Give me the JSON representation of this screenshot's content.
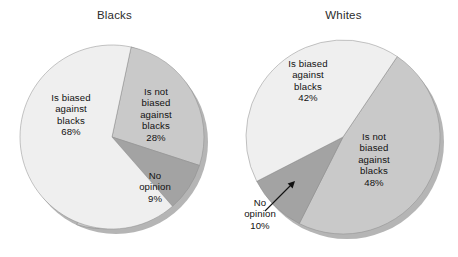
{
  "figure": {
    "background_color": "#ffffff",
    "width": 458,
    "height": 257
  },
  "palette": {
    "slice_light": "#efefef",
    "slice_medium": "#c9c9c9",
    "slice_dark": "#a3a3a3",
    "shadow": "#b5b5b5",
    "edge": "#8d8d8d",
    "text": "#111111",
    "title_text": "#2b2b2b"
  },
  "chart_data": [
    {
      "type": "pie",
      "title": "Blacks",
      "labels": [
        "Is not biased against blacks",
        "No opinion",
        "Is biased against blacks"
      ],
      "values": [
        28,
        9,
        68
      ],
      "value_labels": [
        "28%",
        "9%",
        "68%"
      ],
      "colors": [
        "#c9c9c9",
        "#a3a3a3",
        "#efefef"
      ],
      "legend": "none",
      "start_angle_deg": 12,
      "direction": "clockwise",
      "annotations": [
        {
          "label_lines": [
            "Is not",
            "biased",
            "against",
            "blacks"
          ],
          "percent": "28%",
          "placement": "inside"
        },
        {
          "label_lines": [
            "No",
            "opinion"
          ],
          "percent": "9%",
          "placement": "inside"
        },
        {
          "label_lines": [
            "Is biased",
            "against",
            "blacks"
          ],
          "percent": "68%",
          "placement": "inside"
        }
      ]
    },
    {
      "type": "pie",
      "title": "Whites",
      "labels": [
        "Is not biased against blacks",
        "No opinion",
        "Is biased against blacks"
      ],
      "values": [
        48,
        10,
        42
      ],
      "value_labels": [
        "48%",
        "10%",
        "42%"
      ],
      "colors": [
        "#c9c9c9",
        "#a3a3a3",
        "#efefef"
      ],
      "legend": "none",
      "start_angle_deg": 34,
      "direction": "clockwise",
      "annotations": [
        {
          "label_lines": [
            "Is not",
            "biased",
            "against",
            "blacks"
          ],
          "percent": "48%",
          "placement": "inside"
        },
        {
          "label_lines": [
            "No",
            "opinion"
          ],
          "percent": "10%",
          "placement": "outside",
          "leader": "arrow"
        },
        {
          "label_lines": [
            "Is biased",
            "against",
            "blacks"
          ],
          "percent": "42%",
          "placement": "inside"
        }
      ]
    }
  ],
  "charts": {
    "blacks": {
      "title": "Blacks",
      "not_biased": {
        "l1": "Is not",
        "l2": "biased",
        "l3": "against",
        "l4": "blacks",
        "pct": "28%"
      },
      "no_opinion": {
        "l1": "No",
        "l2": "opinion",
        "pct": "9%"
      },
      "biased": {
        "l1": "Is biased",
        "l2": "against",
        "l3": "blacks",
        "pct": "68%"
      }
    },
    "whites": {
      "title": "Whites",
      "not_biased": {
        "l1": "Is not",
        "l2": "biased",
        "l3": "against",
        "l4": "blacks",
        "pct": "48%"
      },
      "no_opinion": {
        "l1": "No",
        "l2": "opinion",
        "pct": "10%"
      },
      "biased": {
        "l1": "Is biased",
        "l2": "against",
        "l3": "blacks",
        "pct": "42%"
      }
    }
  }
}
